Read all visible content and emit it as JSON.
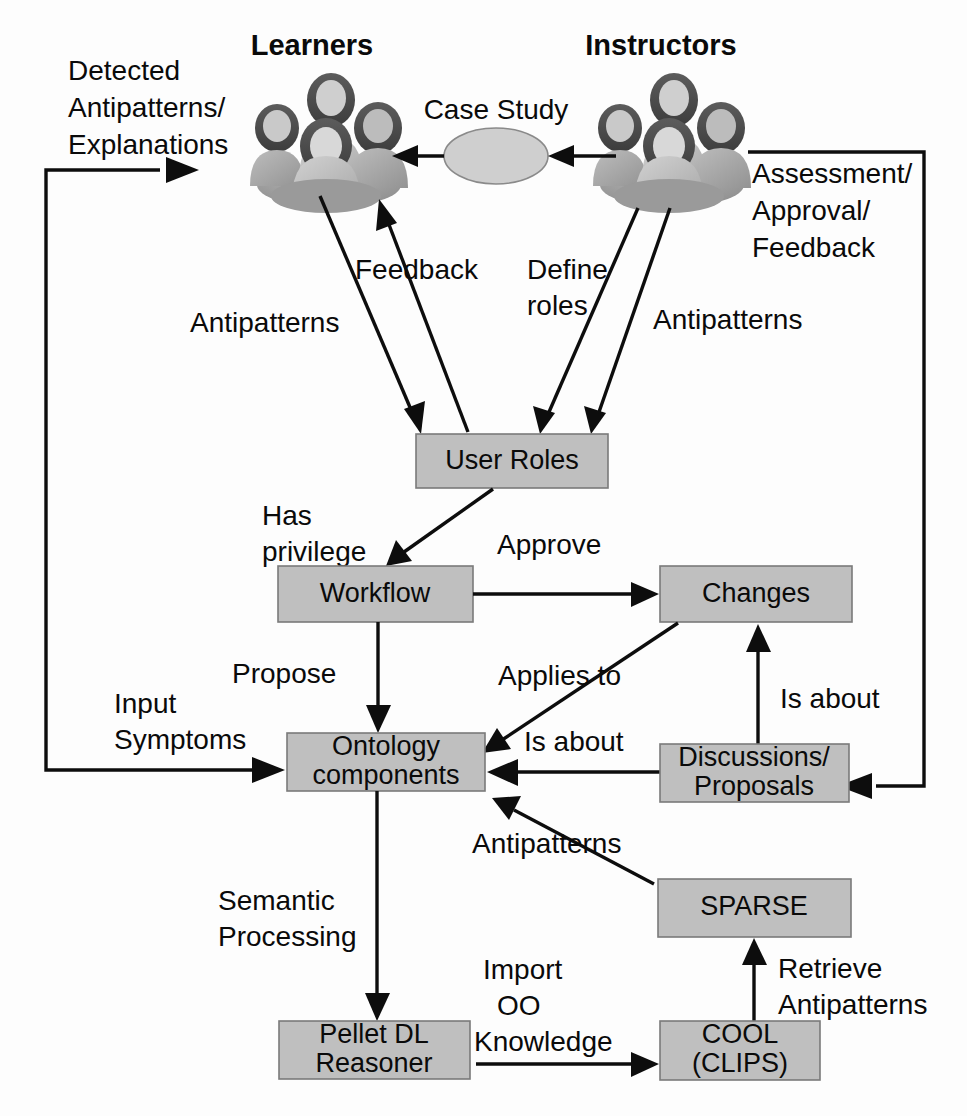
{
  "diagram": {
    "type": "flow-diagram",
    "background_color": "#ffffff",
    "node_fill_color": "#bfbfbf",
    "line_color": "#0d0d0d"
  },
  "actors": [
    {
      "id": "learners",
      "label": "Learners",
      "icon": "people-group-icon"
    },
    {
      "id": "instructors",
      "label": "Instructors",
      "icon": "people-group-icon"
    }
  ],
  "nodes": [
    {
      "id": "case_study",
      "label": "Case Study",
      "shape": "ellipse"
    },
    {
      "id": "user_roles",
      "label": "User Roles",
      "shape": "rect"
    },
    {
      "id": "workflow",
      "label": "Workflow",
      "shape": "rect"
    },
    {
      "id": "changes",
      "label": "Changes",
      "shape": "rect"
    },
    {
      "id": "ontology_components",
      "label_line1": "Ontology",
      "label_line2": "components",
      "shape": "rect"
    },
    {
      "id": "discussions_proposals",
      "label_line1": "Discussions/",
      "label_line2": "Proposals",
      "shape": "rect"
    },
    {
      "id": "sparse",
      "label": "SPARSE",
      "shape": "rect"
    },
    {
      "id": "pellet",
      "label_line1": "Pellet DL",
      "label_line2": "Reasoner",
      "shape": "rect"
    },
    {
      "id": "cool",
      "label_line1": "COOL",
      "label_line2": "(CLIPS)",
      "shape": "rect"
    }
  ],
  "edge_labels": {
    "detected_antipatterns": {
      "line1": "Detected",
      "line2": "Antipatterns/",
      "line3": "Explanations"
    },
    "assessment": {
      "line1": "Assessment/",
      "line2": "Approval/",
      "line3": "Feedback"
    },
    "feedback": "Feedback",
    "antipatterns_left": "Antipatterns",
    "define_roles": {
      "line1": "Define",
      "line2": "roles"
    },
    "antipatterns_right": "Antipatterns",
    "has_privilege": {
      "line1": "Has",
      "line2": "privilege"
    },
    "approve": "Approve",
    "propose": "Propose",
    "applies_to": "Applies to",
    "is_about_left": "Is about",
    "is_about_right": "Is about",
    "input_symptoms": {
      "line1": "Input",
      "line2": "Symptoms"
    },
    "antipatterns_sparse": "Antipatterns",
    "semantic_processing": {
      "line1": "Semantic",
      "line2": "Processing"
    },
    "import_oo_knowledge": {
      "line1": "Import",
      "line2": "OO",
      "line3": "Knowledge"
    },
    "retrieve_antipatterns": {
      "line1": "Retrieve",
      "line2": "Antipatterns"
    }
  }
}
